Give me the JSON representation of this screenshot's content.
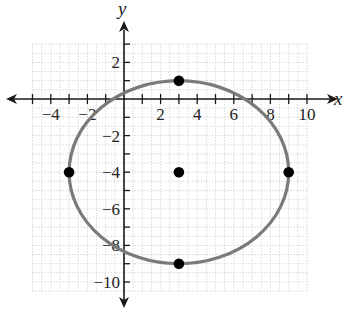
{
  "chart_data": {
    "type": "scatter",
    "title": "",
    "xlabel": "x",
    "ylabel": "y",
    "xlim": [
      -5,
      10.5
    ],
    "ylim": [
      -10.5,
      3.5
    ],
    "grid": true,
    "x_ticks": [
      -4,
      -2,
      2,
      4,
      6,
      8,
      10
    ],
    "y_ticks": [
      2,
      -2,
      -4,
      -6,
      -8,
      -10
    ],
    "x_tick_labels": [
      "−4",
      "−2",
      "2",
      "4",
      "6",
      "8",
      "10"
    ],
    "y_tick_labels": [
      "2",
      "−2",
      "−4",
      "−6",
      "−8",
      "−10"
    ],
    "ellipse": {
      "center": [
        3,
        -4
      ],
      "rx": 6,
      "ry": 5,
      "equation": "(x-3)^2/36 + (y+4)^2/25 = 1",
      "color": "#7a7a7a"
    },
    "points": [
      {
        "label": "center",
        "x": 3,
        "y": -4
      },
      {
        "label": "top vertex",
        "x": 3,
        "y": 1
      },
      {
        "label": "bottom vertex",
        "x": 3,
        "y": -9
      },
      {
        "label": "left vertex",
        "x": -3,
        "y": -4
      },
      {
        "label": "right vertex",
        "x": 9,
        "y": -4
      }
    ],
    "point_color": "#000000",
    "grid_color": "#d8d8d8",
    "axis_color": "#1a1a1a"
  }
}
